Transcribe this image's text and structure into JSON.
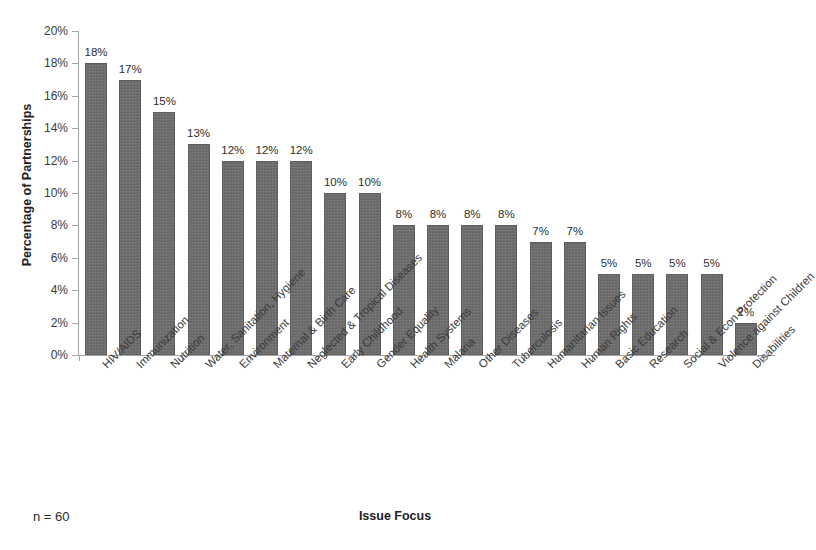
{
  "chart_data": {
    "type": "bar",
    "title": "",
    "xlabel": "Issue Focus",
    "ylabel": "Percentage of Partnerships",
    "ylim": [
      0,
      20
    ],
    "ytick_labels": [
      "20%",
      "18%",
      "16%",
      "14%",
      "12%",
      "10%",
      "8%",
      "6%",
      "4%",
      "2%",
      "0%"
    ],
    "ytick_values": [
      20,
      18,
      16,
      14,
      12,
      10,
      8,
      6,
      4,
      2,
      0
    ],
    "grid": false,
    "legend": false,
    "bar_color": "#6f6f6f",
    "axis_color": "#a6a6a6",
    "categories": [
      "HIV/AIDS",
      "Immunization",
      "Nutrition",
      "Water, Sanitation, Hygiene",
      "Environment",
      "Maternal & Birth Care",
      "Neglected & Tropical Diseases",
      "Early Childhood",
      "Gender Equality",
      "Health Systems",
      "Malaria",
      "Other Diseases",
      "Tuberculosis",
      "Humanitarian Issues",
      "Human Rights",
      "Basic Education",
      "Research",
      "Social & Econ Protection",
      "Violence against Children",
      "Disabilities"
    ],
    "values": [
      18,
      17,
      15,
      13,
      12,
      12,
      12,
      10,
      10,
      8,
      8,
      8,
      8,
      7,
      7,
      5,
      5,
      5,
      5,
      2
    ],
    "value_labels": [
      "18%",
      "17%",
      "15%",
      "13%",
      "12%",
      "12%",
      "12%",
      "10%",
      "10%",
      "8%",
      "8%",
      "8%",
      "8%",
      "7%",
      "7%",
      "5%",
      "5%",
      "5%",
      "5%",
      "2%"
    ]
  },
  "footer": {
    "sample_size": "n = 60"
  }
}
